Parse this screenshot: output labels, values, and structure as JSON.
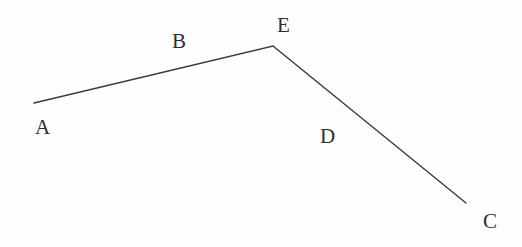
{
  "figure": {
    "type": "geometry-diagram",
    "width": 522,
    "height": 247,
    "background_color": "#fefefe",
    "stroke_color": "#3a3a3a",
    "text_color": "#2f2f2f",
    "stroke_width": 1.4
  },
  "geometry": {
    "points": [
      {
        "id": "A",
        "x": 34,
        "y": 103,
        "role": "endpoint"
      },
      {
        "id": "E",
        "x": 273,
        "y": 46,
        "role": "vertex"
      },
      {
        "id": "C",
        "x": 466,
        "y": 203,
        "role": "endpoint"
      }
    ],
    "segments": [
      {
        "id": "B",
        "from": "A",
        "to": "E",
        "label": "B"
      },
      {
        "id": "D",
        "from": "E",
        "to": "C",
        "label": "D"
      }
    ],
    "polyline": "34,103 273,46 466,203"
  },
  "labels": {
    "vertices": [
      {
        "name": "A",
        "text": "A",
        "x": 35,
        "y": 117
      },
      {
        "name": "E",
        "text": "E",
        "x": 277,
        "y": 15
      },
      {
        "name": "C",
        "text": "C",
        "x": 483,
        "y": 211
      }
    ],
    "segments": [
      {
        "name": "B",
        "text": "B",
        "x": 172,
        "y": 31
      },
      {
        "name": "D",
        "text": "D",
        "x": 320,
        "y": 126
      }
    ]
  }
}
